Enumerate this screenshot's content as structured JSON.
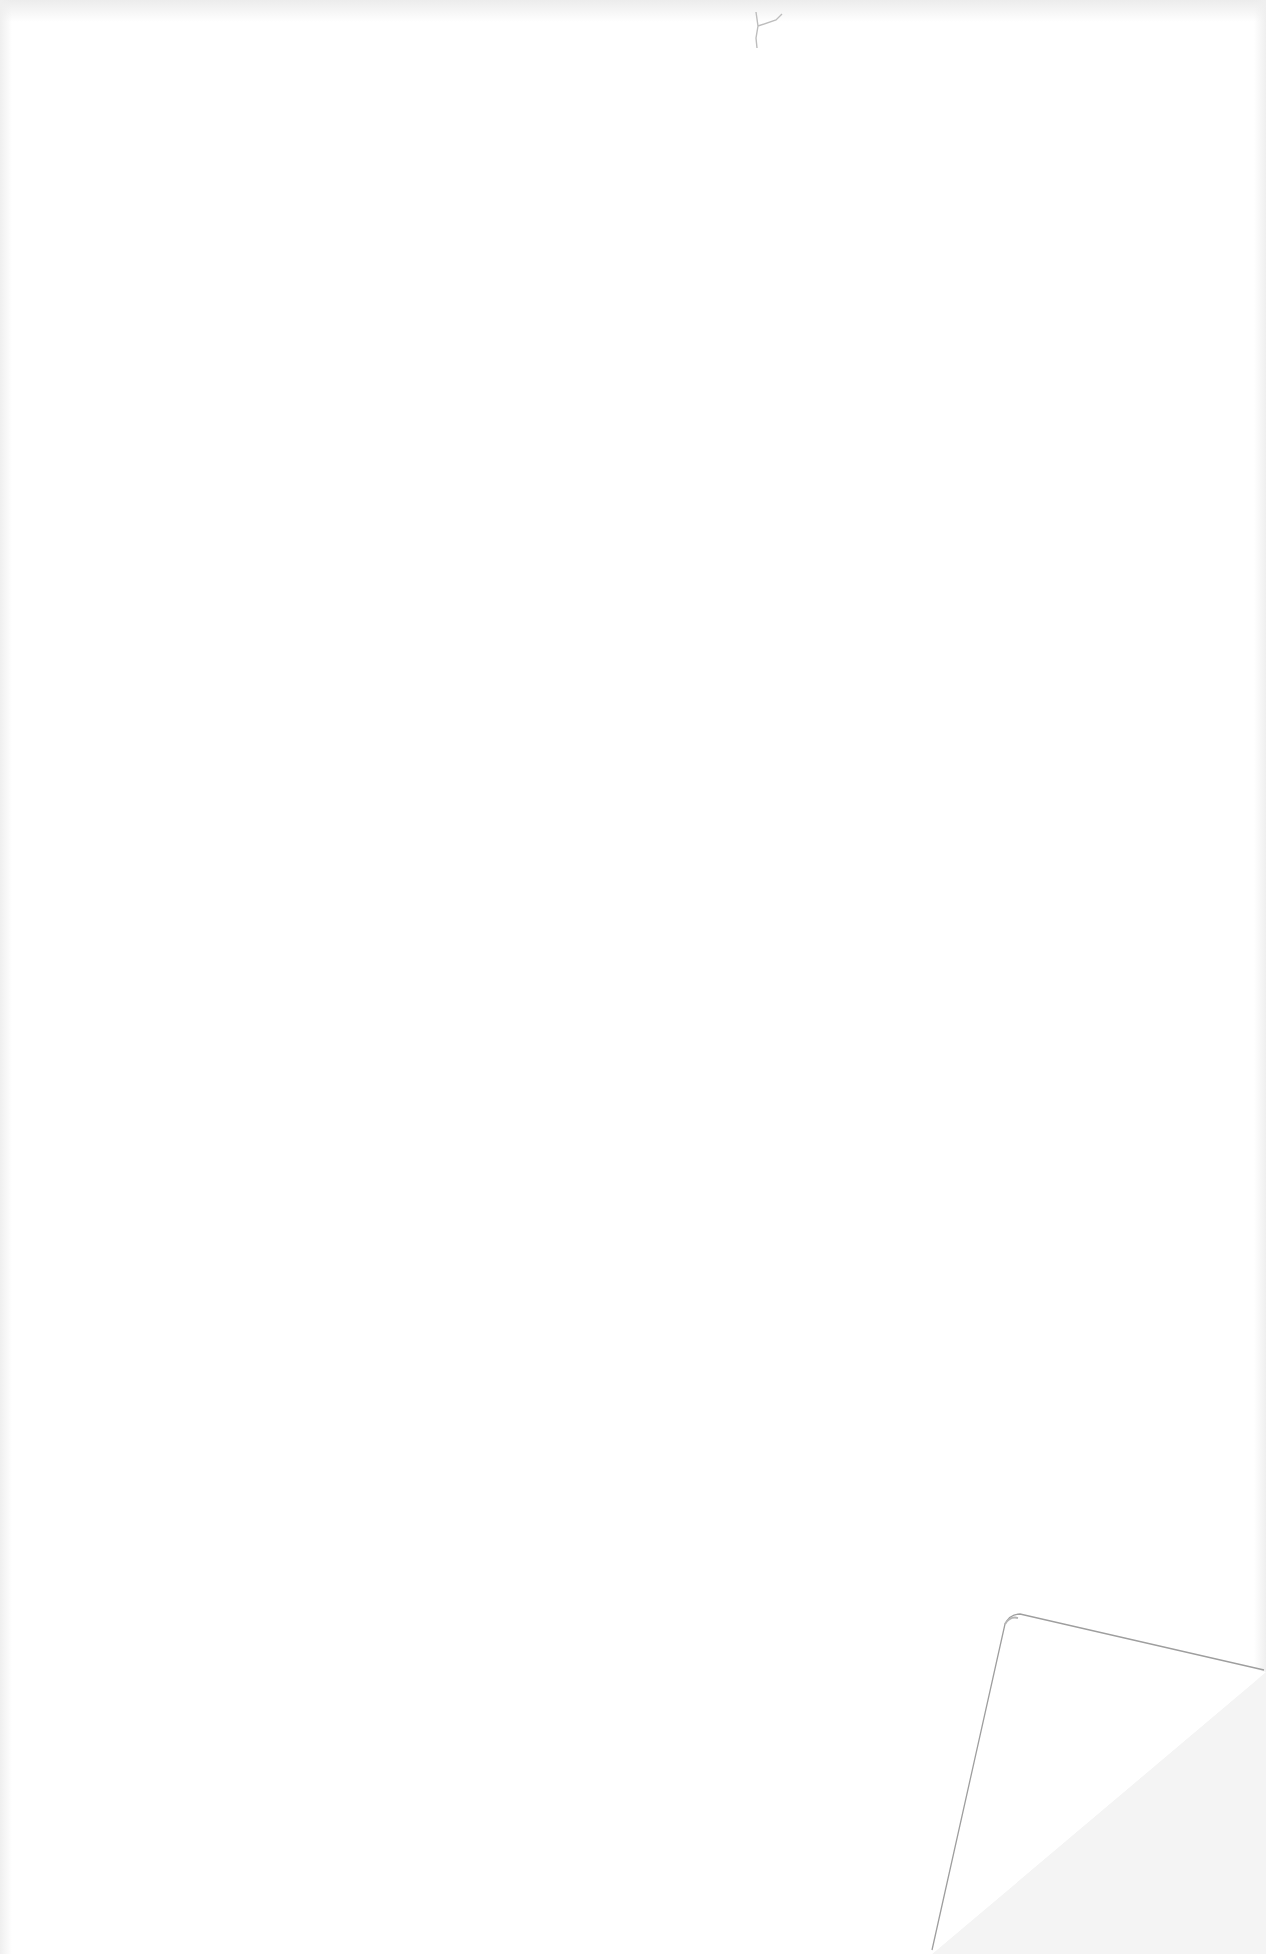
{
  "document": {
    "type": "scanned-page",
    "content": "",
    "features": {
      "blank": true,
      "folded_corner": "bottom-right",
      "mark": "small scratch near top center"
    },
    "colors": {
      "paper": "#ffffff",
      "fold_shadow": "#f3f3f3",
      "fold_line": "#9a9a9a"
    }
  }
}
